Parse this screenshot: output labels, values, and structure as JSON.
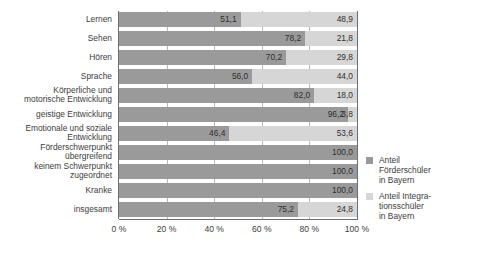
{
  "chart_data": {
    "type": "bar",
    "orientation": "horizontal",
    "stacked": true,
    "title": "",
    "xlabel": "",
    "ylabel": "",
    "xlim": [
      0,
      100
    ],
    "grid": true,
    "legend_position": "right",
    "categories": [
      "Lernen",
      "Sehen",
      "Hören",
      "Sprache",
      "Körperliche und\nmotorische Entwicklung",
      "geistige Entwicklung",
      "Emotionale und soziale\nEntwicklung",
      "Förderschwerpunkt\nübergreifend",
      "keinem Schwerpunkt\nzugeordnet",
      "Kranke",
      "insgesamt"
    ],
    "series": [
      {
        "name": "Anteil\nFörderschüler\nin Bayern",
        "color": "#9a9a9a",
        "values": [
          51.1,
          78.2,
          70.2,
          56.0,
          82.0,
          96.2,
          46.4,
          100.0,
          100.0,
          100.0,
          75.2
        ],
        "labels": [
          "51,1",
          "78,2",
          "70,2",
          "56,0",
          "82,0",
          "96,2",
          "46,4",
          "100,0",
          "100,0",
          "100,0",
          "75,2"
        ]
      },
      {
        "name": "Anteil Integra-\ntionsschüler\nin Bayern",
        "color": "#d6d6d6",
        "values": [
          48.9,
          21.8,
          29.8,
          44.0,
          18.0,
          3.8,
          53.6,
          null,
          null,
          null,
          24.8
        ],
        "labels": [
          "48,9",
          "21,8",
          "29,8",
          "44,0",
          "18,0",
          "3,8",
          "53,6",
          "",
          "",
          "",
          "24,8"
        ]
      }
    ],
    "xticks": [
      0,
      20,
      40,
      60,
      80,
      100
    ],
    "xtick_labels": [
      "0 %",
      "20 %",
      "40 %",
      "60 %",
      "80 %",
      "100 %"
    ]
  },
  "colors": {
    "series_dark": "#9a9a9a",
    "series_light": "#d6d6d6",
    "axis": "#6e6e6e",
    "grid": "#b9b9b9",
    "text": "#3d3d3d",
    "background": "#ffffff"
  }
}
